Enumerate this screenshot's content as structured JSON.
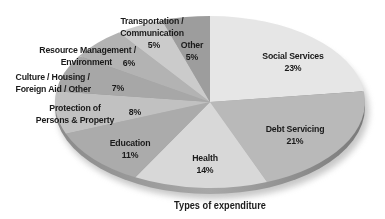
{
  "chart_data": {
    "type": "pie",
    "title": "Types of expenditure",
    "style": "3d-tilted",
    "start_angle": "12 o'clock, clockwise",
    "slices": [
      {
        "label": "Social Services",
        "value": 23,
        "pct_label": "23%",
        "color": "#e6e6e6"
      },
      {
        "label": "Debt Servicing",
        "value": 21,
        "pct_label": "21%",
        "color": "#b9b9b9"
      },
      {
        "label": "Health",
        "value": 14,
        "pct_label": "14%",
        "color": "#d8d8d8"
      },
      {
        "label": "Education",
        "value": 11,
        "pct_label": "11%",
        "color": "#ababab"
      },
      {
        "label": "Protection of Persons & Property",
        "value": 8,
        "pct_label": "8%",
        "color": "#c1c1c1"
      },
      {
        "label": "Culture / Housing / Foreign Aid / Other",
        "value": 7,
        "pct_label": "7%",
        "color": "#a7a7a7"
      },
      {
        "label": "Resource Management / Environment",
        "value": 6,
        "pct_label": "6%",
        "color": "#b3b3b3"
      },
      {
        "label": "Transportation / Communication",
        "value": 5,
        "pct_label": "5%",
        "color": "#cbcbcb"
      },
      {
        "label": "Other",
        "value": 5,
        "pct_label": "5%",
        "color": "#9d9d9d"
      }
    ]
  },
  "labels": {
    "social": {
      "l1": "Social Services",
      "pct": "23%"
    },
    "debt": {
      "l1": "Debt Servicing",
      "pct": "21%"
    },
    "health": {
      "l1": "Health",
      "pct": "14%"
    },
    "education": {
      "l1": "Education",
      "pct": "11%"
    },
    "protection": {
      "l1": "Protection of",
      "l2": "Persons & Property",
      "pct": "8%"
    },
    "culture": {
      "l1": "Culture / Housing /",
      "l2": "Foreign Aid / Other",
      "pct": "7%"
    },
    "resource": {
      "l1": "Resource Management /",
      "l2": "Environment",
      "pct": "6%"
    },
    "transport": {
      "l1": "Transportation /",
      "l2": "Communication",
      "pct": "5%"
    },
    "other": {
      "l1": "Other",
      "pct": "5%"
    }
  },
  "title": "Types of expenditure"
}
